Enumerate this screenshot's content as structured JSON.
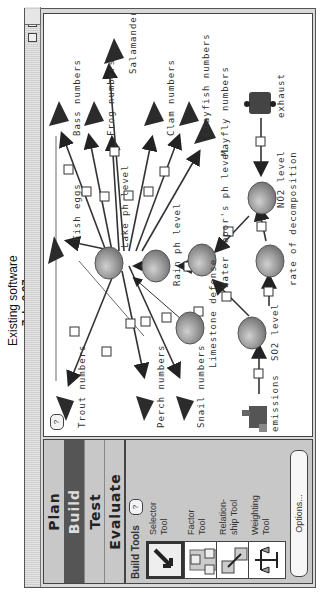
{
  "caption": {
    "title": "Existing software",
    "date": "7. L. 3.97"
  },
  "window": {
    "close_icon": "close-box",
    "zoom_icon": "zoom-box"
  },
  "modes": {
    "tabs": [
      {
        "label": "Plan",
        "active": false
      },
      {
        "label": "Build",
        "active": true
      },
      {
        "label": "Test",
        "active": false
      },
      {
        "label": "Evaluate",
        "active": false
      }
    ]
  },
  "build_tools": {
    "header": "Build Tools",
    "help": "?",
    "tools": [
      {
        "label_1": "Selector",
        "label_2": "Tool",
        "icon": "arrow-icon",
        "selected": true
      },
      {
        "label_1": "Factor",
        "label_2": "Tool",
        "icon": "factor-icon",
        "selected": false
      },
      {
        "label_1": "Relation-",
        "label_2": "ship Tool",
        "icon": "relationship-icon",
        "selected": false
      },
      {
        "label_1": "Weighting",
        "label_2": "Tool",
        "icon": "scale-icon",
        "selected": false
      }
    ],
    "options_label": "Options..."
  },
  "canvas": {
    "help": "?",
    "nodes": {
      "lake_ph": "Lake ph level",
      "rain_ph": "Rain ph level",
      "water_vapor": "Water vapor's ph level",
      "limestone": "Limestone defense",
      "so2": "SO2 level",
      "no2": "NO2 level",
      "decomposition": "rate of decomposition",
      "fish_eggs": "Fish eggs",
      "trout": "Trout numbers",
      "perch": "Perch numbers",
      "snail": "Snail numbers",
      "emissions": "emissions",
      "exhaust": "exhaust",
      "bass": "Bass numbers",
      "frog": "Frog numbers",
      "salamander": "Salamander numbers",
      "clam": "Clam numbers",
      "crayfish": "Crayfish numbers",
      "mayfly": "Mayfly numbers"
    }
  },
  "colors": {
    "panel": "#c8c8c8",
    "active_tab": "#555555",
    "canvas": "#ffffff",
    "line": "#333333"
  }
}
